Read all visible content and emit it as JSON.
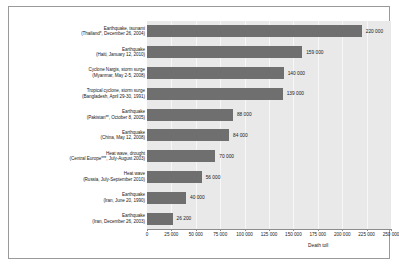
{
  "chart_data": {
    "type": "bar",
    "orientation": "horizontal",
    "title": "",
    "xlabel": "Death toll",
    "ylabel": "",
    "xlim": [
      0,
      250000
    ],
    "grid": true,
    "legend": "none",
    "xticks": [
      "0",
      "25 000",
      "50 000",
      "75 000",
      "100 000",
      "125 000",
      "150 000",
      "175 000",
      "200 000",
      "225 000",
      "250 000"
    ],
    "xtick_values": [
      0,
      25000,
      50000,
      75000,
      100000,
      125000,
      150000,
      175000,
      200000,
      225000,
      250000
    ],
    "categories": [
      "Earthquake, tsunami (Thailand*, December 26, 2004)",
      "Earthquake (Haiti, January 12, 2010)",
      "Cyclone Nargis, storm surge (Myanmar, May 2-5, 2008)",
      "Tropical cyclone, storm surge (Bangladesh, April 29-30, 1991)",
      "Earthquake (Pakistan**, October 8, 2005)",
      "Earthquake (China, May 12, 2008)",
      "Heat wave, drought (Central Europe***, July-August 2003)",
      "Heat wave (Russia, July-September 2010)",
      "Earthquake (Iran, June 20, 1990)",
      "Earthquake (Iran, December 26, 2003)"
    ],
    "category_lines": [
      [
        "Earthquake, tsunami",
        "(Thailand*, December 26, 2004)"
      ],
      [
        "Earthquake",
        "(Haiti, January 12, 2010)"
      ],
      [
        "Cyclone Nargis, storm surge",
        "(Myanmar, May 2-5, 2008)"
      ],
      [
        "Tropical cyclone, storm surge",
        "(Bangladesh, April 29-30, 1991)"
      ],
      [
        "Earthquake",
        "(Pakistan**, October 8, 2005)"
      ],
      [
        "Earthquake",
        "(China, May 12, 2008)"
      ],
      [
        "Heat wave, drought",
        "(Central Europe***, July-August 2003)"
      ],
      [
        "Heat wave",
        "(Russia, July-September 2010)"
      ],
      [
        "Earthquake",
        "(Iran, June 20, 1990)"
      ],
      [
        "Earthquake",
        "(Iran, December 26, 2003)"
      ]
    ],
    "values": [
      220000,
      159000,
      140000,
      139000,
      88000,
      84000,
      70000,
      56000,
      40000,
      26200
    ],
    "value_labels": [
      "220 000",
      "159 000",
      "140 000",
      "139 000",
      "88 000",
      "84 000",
      "70 000",
      "56 000",
      "40 000",
      "26 200"
    ],
    "colors": {
      "bar": "#6f6f6f",
      "plot_background": "#e9e9e9",
      "gridline": "#f7f7f7",
      "axis": "#8c8c8c",
      "text": "#1a1a1a",
      "figure_background": "#ffffff",
      "frame": "#9a9a9a"
    }
  }
}
